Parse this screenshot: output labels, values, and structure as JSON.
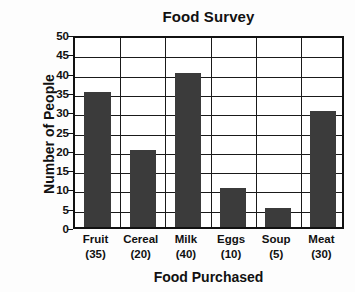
{
  "chart_data": {
    "type": "bar",
    "title": "Food Survey",
    "xlabel": "Food Purchased",
    "ylabel": "Number of People",
    "categories": [
      "Fruit",
      "Cereal",
      "Milk",
      "Eggs",
      "Soup",
      "Meat"
    ],
    "category_labels": [
      "(35)",
      "(20)",
      "(40)",
      "(10)",
      "(5)",
      "(30)"
    ],
    "values": [
      35,
      20,
      40,
      10,
      5,
      30
    ],
    "ylim": [
      0,
      50
    ],
    "ytick_step": 5,
    "yticks": [
      0,
      5,
      10,
      15,
      20,
      25,
      30,
      35,
      40,
      45,
      50
    ],
    "ytick_labels": [
      "0",
      "5",
      "10",
      "15",
      "20",
      "25",
      "30",
      "35",
      "40",
      "45",
      "50"
    ],
    "grid": true,
    "grid_axis": "both",
    "legend": false,
    "bar_color": "#3b3b3b",
    "axis_color": "#111111",
    "background_color": "#ffffff"
  }
}
